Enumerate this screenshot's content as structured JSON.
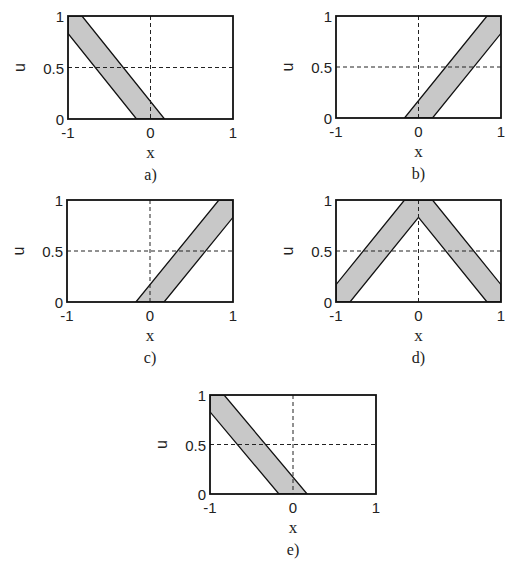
{
  "figure": {
    "panels": [
      {
        "id": "a",
        "caption": "a)",
        "box": [
          68,
          16,
          233,
          119
        ]
      },
      {
        "id": "b",
        "caption": "b)",
        "box": [
          336,
          16,
          501,
          118
        ]
      },
      {
        "id": "c",
        "caption": "c)",
        "box": [
          67,
          200,
          233,
          302
        ]
      },
      {
        "id": "d",
        "caption": "d)",
        "box": [
          336,
          200,
          501,
          302
        ]
      },
      {
        "id": "e",
        "caption": "e)",
        "box": [
          210,
          395,
          376,
          494
        ]
      }
    ]
  },
  "chart_data": [
    {
      "type": "area",
      "panel": "a",
      "caption": "a)",
      "xlabel": "x",
      "ylabel": "u",
      "xlim": [
        -1,
        1
      ],
      "ylim": [
        0,
        1
      ],
      "xticks": [
        "-1",
        "0",
        "1"
      ],
      "yticks": [
        "0",
        "0.5",
        "1"
      ],
      "grid": {
        "x": [
          0
        ],
        "y": [
          0.5
        ],
        "style": "dashed"
      },
      "band": {
        "fill": "#c8c8c8",
        "edge": "#111111",
        "polygon": [
          [
            -1,
            1
          ],
          [
            -0.83,
            1
          ],
          [
            0.17,
            0
          ],
          [
            -0.17,
            0
          ],
          [
            -1,
            0.83
          ]
        ]
      }
    },
    {
      "type": "area",
      "panel": "b",
      "caption": "b)",
      "xlabel": "x",
      "ylabel": "u",
      "xlim": [
        -1,
        1
      ],
      "ylim": [
        0,
        1
      ],
      "xticks": [
        "-1",
        "0",
        "1"
      ],
      "yticks": [
        "0",
        "0.5",
        "1"
      ],
      "grid": {
        "x": [
          0
        ],
        "y": [
          0.5
        ],
        "style": "dashed"
      },
      "band": {
        "fill": "#c8c8c8",
        "edge": "#111111",
        "polygon": [
          [
            0.83,
            1
          ],
          [
            1,
            1
          ],
          [
            1,
            0.83
          ],
          [
            0.17,
            0
          ],
          [
            -0.17,
            0
          ]
        ]
      }
    },
    {
      "type": "area",
      "panel": "c",
      "caption": "c)",
      "xlabel": "x",
      "ylabel": "u",
      "xlim": [
        -1,
        1
      ],
      "ylim": [
        0,
        1
      ],
      "xticks": [
        "-1",
        "0",
        "1"
      ],
      "yticks": [
        "0",
        "0.5",
        "1"
      ],
      "grid": {
        "x": [
          0
        ],
        "y": [
          0.5
        ],
        "style": "dashed"
      },
      "band": {
        "fill": "#c8c8c8",
        "edge": "#111111",
        "polygon": [
          [
            0.83,
            1
          ],
          [
            1,
            1
          ],
          [
            1,
            0.83
          ],
          [
            0.17,
            0
          ],
          [
            -0.17,
            0
          ]
        ]
      }
    },
    {
      "type": "area",
      "panel": "d",
      "caption": "d)",
      "xlabel": "x",
      "ylabel": "u",
      "xlim": [
        -1,
        1
      ],
      "ylim": [
        0,
        1
      ],
      "xticks": [
        "-1",
        "0",
        "1"
      ],
      "yticks": [
        "0",
        "0.5",
        "1"
      ],
      "grid": {
        "x": [
          0
        ],
        "y": [
          0.5
        ],
        "style": "dashed"
      },
      "band": {
        "fill": "#c8c8c8",
        "edge": "#111111",
        "polygon": [
          [
            -1,
            0.17
          ],
          [
            -0.17,
            1
          ],
          [
            0.17,
            1
          ],
          [
            1,
            0.17
          ],
          [
            1,
            0
          ],
          [
            0.83,
            0
          ],
          [
            0,
            0.83
          ],
          [
            -0.83,
            0
          ],
          [
            -1,
            0
          ]
        ]
      }
    },
    {
      "type": "area",
      "panel": "e",
      "caption": "e)",
      "xlabel": "x",
      "ylabel": "u",
      "xlim": [
        -1,
        1
      ],
      "ylim": [
        0,
        1
      ],
      "xticks": [
        "-1",
        "0",
        "1"
      ],
      "yticks": [
        "0",
        "0.5",
        "1"
      ],
      "grid": {
        "x": [
          0
        ],
        "y": [
          0.5
        ],
        "style": "dashed"
      },
      "band": {
        "fill": "#c8c8c8",
        "edge": "#111111",
        "polygon": [
          [
            -1,
            1
          ],
          [
            -0.83,
            1
          ],
          [
            0.17,
            0
          ],
          [
            -0.17,
            0
          ],
          [
            -1,
            0.83
          ]
        ]
      }
    }
  ]
}
